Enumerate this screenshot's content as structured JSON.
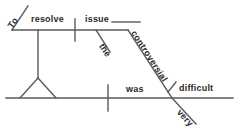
{
  "diagram": {
    "type": "reed-kellogg-sentence-diagram",
    "sentence": "To resolve the controversial issue was very difficult.",
    "line_color": "#5a5a5a",
    "text_color": "#2b2b2b",
    "background_color": "#ffffff",
    "words": {
      "to": "To",
      "resolve": "resolve",
      "the": "the",
      "controversial": "controversial",
      "issue": "issue",
      "was": "was",
      "very": "very",
      "difficult": "difficult"
    },
    "labels": {
      "upper_baseline": "infinitive-phrase-baseline",
      "lower_baseline": "main-clause-baseline",
      "subject_verb_divider": "subject-verb-divider",
      "verb_complement_divider": "verb-complement-divider",
      "pedestal": "infinitive-pedestal",
      "tripod": "infinitive-tripod"
    }
  }
}
